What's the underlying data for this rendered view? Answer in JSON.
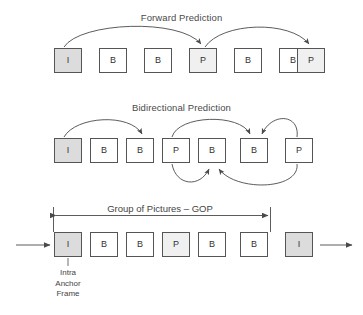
{
  "diagram": {
    "sections": [
      {
        "id": "forward",
        "title": "Forward Prediction",
        "frames": [
          {
            "label": "I",
            "type": "intra",
            "shaded": true
          },
          {
            "label": "B",
            "type": "bidirectional",
            "shaded": false
          },
          {
            "label": "B",
            "type": "bidirectional",
            "shaded": false
          },
          {
            "label": "P",
            "type": "predicted",
            "shaded": true
          },
          {
            "label": "B",
            "type": "bidirectional",
            "shaded": false
          },
          {
            "label": "B",
            "type": "bidirectional",
            "shaded": false
          },
          {
            "label": "P",
            "type": "predicted",
            "shaded": true
          }
        ],
        "arrows": [
          {
            "from": 0,
            "to": 3,
            "direction": "forward"
          },
          {
            "from": 3,
            "to": 6,
            "direction": "forward"
          }
        ]
      },
      {
        "id": "bidirectional",
        "title": "Bidirectional Prediction",
        "frames": [
          {
            "label": "I",
            "type": "intra",
            "shaded": true
          },
          {
            "label": "B",
            "type": "bidirectional",
            "shaded": false
          },
          {
            "label": "B",
            "type": "bidirectional",
            "shaded": false
          },
          {
            "label": "P",
            "type": "predicted",
            "shaded": false
          },
          {
            "label": "B",
            "type": "bidirectional",
            "shaded": false
          },
          {
            "label": "B",
            "type": "bidirectional",
            "shaded": false
          },
          {
            "label": "P",
            "type": "predicted",
            "shaded": false
          }
        ],
        "arrows": [
          {
            "from": 0,
            "to": 2,
            "direction": "forward-top"
          },
          {
            "from": 3,
            "to": 5,
            "direction": "forward-top"
          },
          {
            "from": 6,
            "to": 5,
            "direction": "backward-top"
          },
          {
            "from": 3,
            "to": 4,
            "direction": "forward-bottom"
          },
          {
            "from": 6,
            "to": 4,
            "direction": "backward-bottom"
          }
        ]
      },
      {
        "id": "gop",
        "title": "",
        "bracket_label": "Group of Pictures – GOP",
        "anchor_label": "Intra\nAnchor\nFrame",
        "anchor_label_lines": [
          "Intra",
          "Anchor",
          "Frame"
        ],
        "frames": [
          {
            "label": "I",
            "type": "intra",
            "shaded": true
          },
          {
            "label": "B",
            "type": "bidirectional",
            "shaded": false
          },
          {
            "label": "B",
            "type": "bidirectional",
            "shaded": false
          },
          {
            "label": "P",
            "type": "predicted",
            "shaded": true
          },
          {
            "label": "B",
            "type": "bidirectional",
            "shaded": false
          },
          {
            "label": "B",
            "type": "bidirectional",
            "shaded": false
          },
          {
            "label": "I",
            "type": "intra",
            "shaded": true
          }
        ],
        "entry_arrow": true,
        "exit_arrow": true
      }
    ],
    "colors": {
      "background": "#ffffff",
      "box_border": "#555555",
      "box_fill": "#ffffff",
      "box_fill_shaded": "#dcdcdc",
      "text": "#3a3a3a",
      "arrow": "#4a4a4a"
    }
  }
}
